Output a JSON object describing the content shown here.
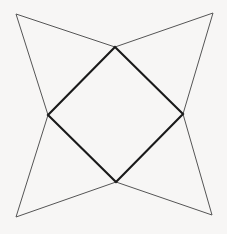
{
  "figure": {
    "type": "line-drawing",
    "canvas": {
      "width": 227,
      "height": 234,
      "background_color": "#f7f6f5"
    },
    "styles": {
      "outer_star_stroke_color": "#555555",
      "outer_star_stroke_width": 1,
      "inner_square_stroke_color": "#1a1a1a",
      "inner_square_stroke_width": 2.1,
      "fill": "none"
    },
    "points": {
      "outer_top_left": {
        "label": "outer-top-left",
        "x": 16,
        "y": 14
      },
      "outer_top_right": {
        "label": "outer-top-right",
        "x": 213,
        "y": 13
      },
      "outer_bottom_right": {
        "label": "outer-bottom-right",
        "x": 212,
        "y": 215
      },
      "outer_bottom_left": {
        "label": "outer-bottom-left",
        "x": 16,
        "y": 217
      },
      "inner_top": {
        "label": "inner-top",
        "x": 115,
        "y": 47
      },
      "inner_right": {
        "label": "inner-right",
        "x": 183,
        "y": 114
      },
      "inner_bottom": {
        "label": "inner-bottom",
        "x": 116,
        "y": 182
      },
      "inner_left": {
        "label": "inner-left",
        "x": 48,
        "y": 115
      }
    },
    "paths": {
      "inner_square": "M 115 47 L 183 114 L 116 182 L 48 115 Z",
      "star_point_top_left": "M 115 47 L 16 14 L 48 115",
      "star_point_top_right": "M 115 47 L 213 13 L 183 114",
      "star_point_bottom_right": "M 183 114 L 212 215 L 116 182",
      "star_point_bottom_left": "M 116 182 L 16 217 L 48 115"
    }
  }
}
